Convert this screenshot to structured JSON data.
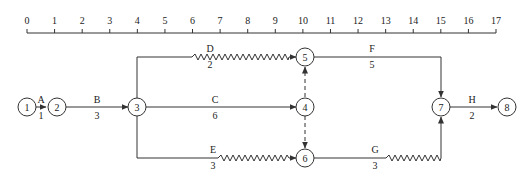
{
  "diagram": {
    "type": "time-scaled network diagram",
    "time_axis": {
      "ticks": [
        "0",
        "1",
        "2",
        "3",
        "4",
        "5",
        "6",
        "7",
        "8",
        "9",
        "10",
        "11",
        "12",
        "13",
        "14",
        "15",
        "16",
        "17"
      ]
    },
    "nodes": [
      {
        "id": "1",
        "label": "1",
        "time": 0,
        "row": "middle"
      },
      {
        "id": "2",
        "label": "2",
        "time": 1,
        "row": "middle"
      },
      {
        "id": "3",
        "label": "3",
        "time": 4,
        "row": "middle"
      },
      {
        "id": "4",
        "label": "4",
        "time": 10,
        "row": "middle"
      },
      {
        "id": "5",
        "label": "5",
        "time": 10,
        "row": "top"
      },
      {
        "id": "6",
        "label": "6",
        "time": 10,
        "row": "bottom"
      },
      {
        "id": "7",
        "label": "7",
        "time": 15,
        "row": "middle"
      },
      {
        "id": "8",
        "label": "8",
        "time": 17,
        "row": "middle"
      }
    ],
    "activities": [
      {
        "name": "A",
        "duration": "1",
        "from": "1",
        "to": "2",
        "free_float": 0
      },
      {
        "name": "B",
        "duration": "3",
        "from": "2",
        "to": "3",
        "free_float": 0
      },
      {
        "name": "C",
        "duration": "6",
        "from": "3",
        "to": "4",
        "free_float": 0
      },
      {
        "name": "D",
        "duration": "2",
        "from": "3",
        "to": "5",
        "free_float": 4
      },
      {
        "name": "E",
        "duration": "3",
        "from": "3",
        "to": "6",
        "free_float": 3
      },
      {
        "name": "F",
        "duration": "5",
        "from": "5",
        "to": "7",
        "free_float": 0
      },
      {
        "name": "G",
        "duration": "3",
        "from": "6",
        "to": "7",
        "free_float": 2
      },
      {
        "name": "H",
        "duration": "2",
        "from": "7",
        "to": "8",
        "free_float": 0
      }
    ],
    "dummies": [
      {
        "from": "4",
        "to": "5"
      },
      {
        "from": "4",
        "to": "6"
      }
    ]
  }
}
